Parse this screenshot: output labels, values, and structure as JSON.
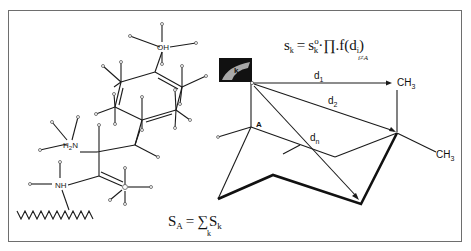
{
  "diagram": {
    "type": "molecular-interaction-scoring-schematic",
    "left_molecule": {
      "atoms": [
        "OH",
        "H2N",
        "NH",
        "O"
      ],
      "labels": {
        "hydroxyl": "OH",
        "amine_main": "H",
        "amine_sub": "2",
        "amine_N": "N",
        "amide": "NH",
        "carbonyl_O": "O"
      },
      "backbone": "zigzag-chain"
    },
    "right_molecule": {
      "site_label": "k",
      "anchor_label": "A",
      "methyl_top": {
        "main": "CH",
        "sub": "3"
      },
      "methyl_right": {
        "main": "CH",
        "sub": "3"
      },
      "distances": [
        {
          "main": "d",
          "sub": "1"
        },
        {
          "main": "d",
          "sub": "2"
        },
        {
          "main": "d",
          "sub": "n"
        }
      ]
    },
    "equations": {
      "top": {
        "lhs": "s",
        "lhs_sub": "k",
        "eq": "=",
        "rhs_s": "s",
        "rhs_sup": "o",
        "rhs_sub": "k",
        "dot1": "·",
        "prod": "∏",
        "prod_sub": "i≠A",
        "dot2": ".",
        "func": "f(d",
        "func_sub": "i",
        "func_close": ")"
      },
      "bottom": {
        "lhs": "S",
        "lhs_sub": "A",
        "eq": "=",
        "sum": "∑",
        "sum_sub": "k",
        "rhs": "S",
        "rhs_sub": "k"
      }
    },
    "colors": {
      "line": "#1a1a1a",
      "border": "#6e6e6e",
      "site_box": "#111111",
      "site_patch": "#a8a8a8",
      "background": "#ffffff"
    }
  }
}
